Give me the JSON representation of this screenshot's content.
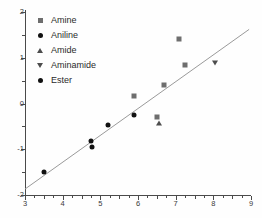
{
  "chart_data": {
    "type": "scatter",
    "title": "",
    "xlabel": "",
    "ylabel": "",
    "xlim": [
      3,
      9
    ],
    "ylim": [
      -2,
      2
    ],
    "xticks": [
      "3",
      "4",
      "5",
      "6",
      "7",
      "8",
      "9"
    ],
    "yticks": [
      "2",
      "1",
      "0",
      "-1",
      "-2"
    ],
    "grid": false,
    "legend_position": "top-left",
    "series": [
      {
        "name": "Amine",
        "marker": "square",
        "color": "#6e6e6e",
        "points": [
          {
            "x": 5.9,
            "y": 0.17
          },
          {
            "x": 6.5,
            "y": -0.3
          },
          {
            "x": 6.7,
            "y": 0.4
          },
          {
            "x": 7.1,
            "y": 1.4
          },
          {
            "x": 7.25,
            "y": 0.85
          }
        ]
      },
      {
        "name": "Aniline",
        "marker": "circle",
        "color": "#111111",
        "points": [
          {
            "x": 4.75,
            "y": -0.82
          },
          {
            "x": 4.78,
            "y": -0.95
          },
          {
            "x": 5.2,
            "y": -0.47
          },
          {
            "x": 5.9,
            "y": -0.25
          }
        ]
      },
      {
        "name": "Amide",
        "marker": "triangle-up",
        "color": "#4d4d4d",
        "points": [
          {
            "x": 6.55,
            "y": -0.43
          }
        ]
      },
      {
        "name": "Aminamide",
        "marker": "triangle-down",
        "color": "#4d4d4d",
        "points": [
          {
            "x": 8.05,
            "y": 0.88
          }
        ]
      },
      {
        "name": "Ester",
        "marker": "diamond",
        "color": "#111111",
        "points": [
          {
            "x": 3.5,
            "y": -1.5
          }
        ]
      }
    ],
    "trendline": {
      "x1": 3.0,
      "y1": -1.87,
      "x2": 8.95,
      "y2": 1.62,
      "color": "#9a9a9a"
    },
    "legend": [
      {
        "label": "Amine",
        "marker": "square"
      },
      {
        "label": "Aniline",
        "marker": "circle"
      },
      {
        "label": "Amide",
        "marker": "triangle-up"
      },
      {
        "label": "Aminamide",
        "marker": "triangle-down"
      },
      {
        "label": "Ester",
        "marker": "diamond"
      }
    ]
  }
}
